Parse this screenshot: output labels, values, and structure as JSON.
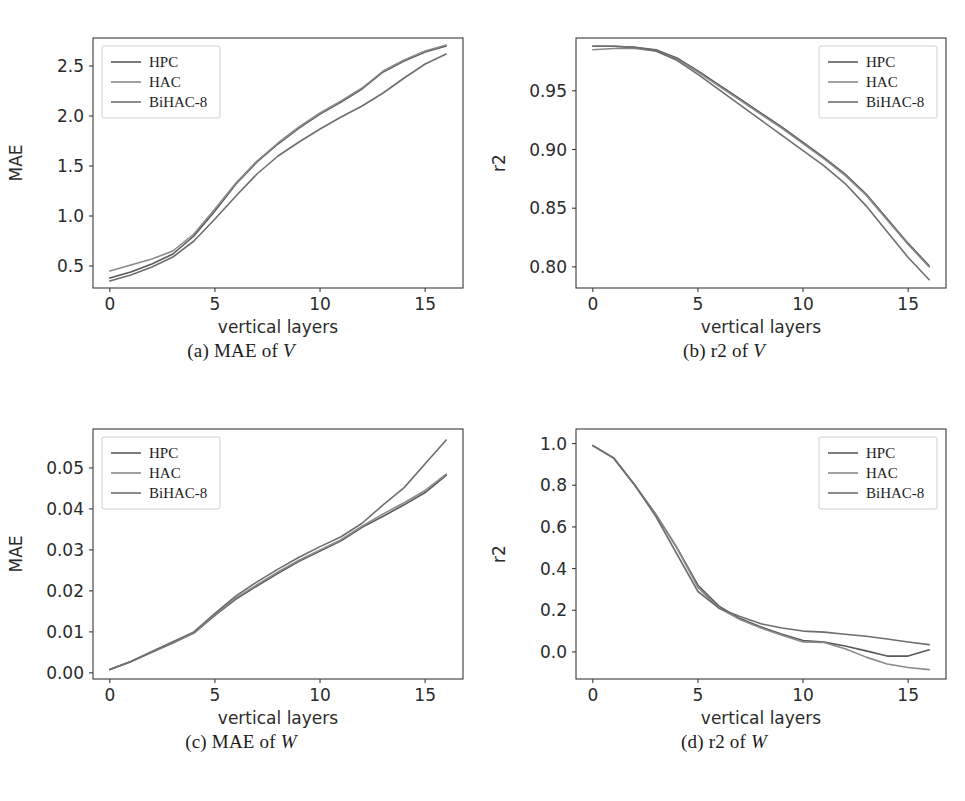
{
  "figure": {
    "panels": [
      {
        "id": "panel-a",
        "caption_prefix": "(a) MAE of ",
        "caption_var": "V",
        "caption_full": "(a) MAE of V"
      },
      {
        "id": "panel-b",
        "caption_prefix": "(b) r2 of ",
        "caption_var": "V",
        "caption_full": "(b) r2 of V"
      },
      {
        "id": "panel-c",
        "caption_prefix": "(c) MAE of ",
        "caption_var": "W",
        "caption_full": "(c) MAE of W"
      },
      {
        "id": "panel-d",
        "caption_prefix": "(d) r2 of ",
        "caption_var": "W",
        "caption_full": "(d) r2 of W"
      }
    ]
  },
  "style": {
    "series_colors": [
      "#5a5a5a",
      "#8a8a8a",
      "#6e6e6e"
    ],
    "axis_color": "#3a3a3a",
    "background": "#ffffff"
  },
  "chart_data": [
    {
      "type": "line",
      "id": "panel-a",
      "title": "(a) MAE of V",
      "xlabel": "vertical layers",
      "ylabel": "MAE",
      "xlim": [
        -0.8,
        16.8
      ],
      "ylim": [
        0.28,
        2.78
      ],
      "xticks": [
        0,
        5,
        10,
        15
      ],
      "xticklabels": [
        "0",
        "5",
        "10",
        "15"
      ],
      "yticks": [
        0.5,
        1.0,
        1.5,
        2.0,
        2.5
      ],
      "yticklabels": [
        "0.5",
        "1.0",
        "1.5",
        "2.0",
        "2.5"
      ],
      "grid": false,
      "legend_position": "upper left",
      "x": [
        0,
        1,
        2,
        3,
        4,
        5,
        6,
        7,
        8,
        9,
        10,
        11,
        12,
        13,
        14,
        15,
        16
      ],
      "series": [
        {
          "name": "HPC",
          "values": [
            0.38,
            0.44,
            0.52,
            0.62,
            0.8,
            1.05,
            1.32,
            1.54,
            1.72,
            1.88,
            2.02,
            2.14,
            2.27,
            2.44,
            2.55,
            2.64,
            2.7
          ]
        },
        {
          "name": "HAC",
          "values": [
            0.45,
            0.51,
            0.57,
            0.65,
            0.82,
            1.07,
            1.33,
            1.55,
            1.73,
            1.89,
            2.03,
            2.15,
            2.28,
            2.45,
            2.56,
            2.65,
            2.71
          ]
        },
        {
          "name": "BiHAC-8",
          "values": [
            0.35,
            0.41,
            0.49,
            0.59,
            0.75,
            0.97,
            1.2,
            1.42,
            1.6,
            1.74,
            1.87,
            1.99,
            2.1,
            2.23,
            2.38,
            2.52,
            2.62
          ]
        }
      ]
    },
    {
      "type": "line",
      "id": "panel-b",
      "title": "(b) r2 of V",
      "xlabel": "vertical layers",
      "ylabel": "r2",
      "xlim": [
        -0.8,
        16.8
      ],
      "ylim": [
        0.782,
        0.995
      ],
      "xticks": [
        0,
        5,
        10,
        15
      ],
      "xticklabels": [
        "0",
        "5",
        "10",
        "15"
      ],
      "yticks": [
        0.8,
        0.85,
        0.9,
        0.95
      ],
      "yticklabels": [
        "0.80",
        "0.85",
        "0.90",
        "0.95"
      ],
      "grid": false,
      "legend_position": "upper right",
      "x": [
        0,
        1,
        2,
        3,
        4,
        5,
        6,
        7,
        8,
        9,
        10,
        11,
        12,
        13,
        14,
        15,
        16
      ],
      "series": [
        {
          "name": "HPC",
          "values": [
            0.988,
            0.988,
            0.987,
            0.985,
            0.978,
            0.967,
            0.955,
            0.943,
            0.931,
            0.919,
            0.906,
            0.893,
            0.879,
            0.862,
            0.841,
            0.82,
            0.801
          ]
        },
        {
          "name": "HAC",
          "values": [
            0.985,
            0.986,
            0.986,
            0.984,
            0.977,
            0.966,
            0.954,
            0.942,
            0.93,
            0.918,
            0.905,
            0.892,
            0.878,
            0.861,
            0.84,
            0.819,
            0.8
          ]
        },
        {
          "name": "BiHAC-8",
          "values": [
            0.988,
            0.988,
            0.987,
            0.984,
            0.976,
            0.964,
            0.951,
            0.938,
            0.925,
            0.912,
            0.899,
            0.886,
            0.871,
            0.852,
            0.83,
            0.808,
            0.789
          ]
        }
      ]
    },
    {
      "type": "line",
      "id": "panel-c",
      "title": "(c) MAE of W",
      "xlabel": "vertical layers",
      "ylabel": "MAE",
      "xlim": [
        -0.8,
        16.8
      ],
      "ylim": [
        -0.0015,
        0.0595
      ],
      "xticks": [
        0,
        5,
        10,
        15
      ],
      "xticklabels": [
        "0",
        "5",
        "10",
        "15"
      ],
      "yticks": [
        0.0,
        0.01,
        0.02,
        0.03,
        0.04,
        0.05
      ],
      "yticklabels": [
        "0.00",
        "0.01",
        "0.02",
        "0.03",
        "0.04",
        "0.05"
      ],
      "grid": false,
      "legend_position": "upper left",
      "x": [
        0,
        1,
        2,
        3,
        4,
        5,
        6,
        7,
        8,
        9,
        10,
        11,
        12,
        13,
        14,
        15,
        16
      ],
      "series": [
        {
          "name": "HPC",
          "values": [
            0.0008,
            0.0027,
            0.005,
            0.0073,
            0.0097,
            0.014,
            0.018,
            0.0212,
            0.0243,
            0.0272,
            0.0297,
            0.0322,
            0.0355,
            0.0382,
            0.041,
            0.044,
            0.0482
          ]
        },
        {
          "name": "HAC",
          "values": [
            0.0008,
            0.0028,
            0.0051,
            0.0074,
            0.0098,
            0.0142,
            0.0183,
            0.0215,
            0.0246,
            0.0275,
            0.03,
            0.0325,
            0.0358,
            0.0388,
            0.0415,
            0.0445,
            0.0485
          ]
        },
        {
          "name": "BiHAC-8",
          "values": [
            0.0008,
            0.0028,
            0.0052,
            0.0076,
            0.01,
            0.0145,
            0.0188,
            0.0222,
            0.0253,
            0.0282,
            0.0308,
            0.0332,
            0.0365,
            0.041,
            0.0452,
            0.051,
            0.0568
          ]
        }
      ]
    },
    {
      "type": "line",
      "id": "panel-d",
      "title": "(d) r2 of W",
      "xlabel": "vertical layers",
      "ylabel": "r2",
      "xlim": [
        -0.8,
        16.8
      ],
      "ylim": [
        -0.13,
        1.07
      ],
      "xticks": [
        0,
        5,
        10,
        15
      ],
      "xticklabels": [
        "0",
        "5",
        "10",
        "15"
      ],
      "yticks": [
        0.0,
        0.2,
        0.4,
        0.6,
        0.8,
        1.0
      ],
      "yticklabels": [
        "0.0",
        "0.2",
        "0.4",
        "0.6",
        "0.8",
        "1.0"
      ],
      "grid": false,
      "legend_position": "upper right",
      "x": [
        0,
        1,
        2,
        3,
        4,
        5,
        6,
        7,
        8,
        9,
        10,
        11,
        12,
        13,
        14,
        15,
        16
      ],
      "series": [
        {
          "name": "HPC",
          "values": [
            0.99,
            0.93,
            0.8,
            0.66,
            0.5,
            0.32,
            0.22,
            0.16,
            0.12,
            0.085,
            0.055,
            0.047,
            0.028,
            0.005,
            -0.02,
            -0.02,
            0.01
          ]
        },
        {
          "name": "HAC",
          "values": [
            0.99,
            0.93,
            0.8,
            0.66,
            0.5,
            0.31,
            0.21,
            0.155,
            0.115,
            0.08,
            0.048,
            0.045,
            0.015,
            -0.025,
            -0.058,
            -0.075,
            -0.085
          ]
        },
        {
          "name": "BiHAC-8",
          "values": [
            0.99,
            0.93,
            0.8,
            0.65,
            0.47,
            0.29,
            0.21,
            0.17,
            0.135,
            0.115,
            0.1,
            0.095,
            0.085,
            0.075,
            0.062,
            0.048,
            0.035
          ]
        }
      ]
    }
  ],
  "legend": {
    "entries": [
      "HPC",
      "HAC",
      "BiHAC-8"
    ]
  },
  "axis_text": {
    "xlabel": "vertical layers",
    "ylabel_mae": "MAE",
    "ylabel_r2": "r2"
  }
}
